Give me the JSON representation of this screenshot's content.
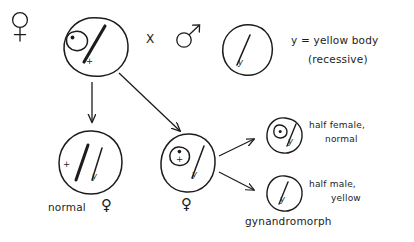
{
  "diagram": {
    "title_present": false,
    "type": "genetics-cross-diagram",
    "ink_color": "#1c1c1c",
    "background": "#ffffff"
  },
  "symbols": {
    "female": "♀",
    "male": "♂",
    "cross": "X",
    "wild_type_allele": "+",
    "yellow_allele": "y"
  },
  "parents": {
    "female_symbol": "♀",
    "female_cell": {
      "name": "ring-x-female-parent",
      "chromosomes": [
        {
          "kind": "ring",
          "label": ""
        },
        {
          "kind": "rod",
          "label": "+"
        }
      ]
    },
    "cross_symbol": "X",
    "male_symbol": "♂",
    "male_cell": {
      "name": "male-parent",
      "chromosomes": [
        {
          "kind": "rod",
          "label": "y"
        }
      ]
    }
  },
  "legend": {
    "line1": "y = yellow body",
    "line2": "(recessive)"
  },
  "offspring": {
    "normal_female": {
      "cell_name": "normal-female-zygote",
      "chromosomes": [
        {
          "kind": "rod-thick",
          "label": "+"
        },
        {
          "kind": "rod",
          "label": "y"
        }
      ],
      "caption": "normal",
      "caption_symbol": "♀"
    },
    "ring_female": {
      "cell_name": "ring-female-zygote",
      "chromosomes": [
        {
          "kind": "ring",
          "label": "+"
        },
        {
          "kind": "rod",
          "label": "y"
        }
      ],
      "caption_symbol": "♀"
    }
  },
  "gynandromorph": {
    "group_caption": "gynandromorph",
    "half_female": {
      "cell_name": "half-female-cell",
      "chromosomes": [
        {
          "kind": "ring",
          "label": ""
        },
        {
          "kind": "rod",
          "label": "y"
        }
      ],
      "line1": "half female,",
      "line2": "normal"
    },
    "half_male": {
      "cell_name": "half-male-cell",
      "chromosomes": [
        {
          "kind": "rod",
          "label": "y"
        }
      ],
      "line1": "half male,",
      "line2": "yellow"
    }
  },
  "arrows": [
    {
      "name": "arrow-parent-to-normal-female",
      "from": "female-parent-cell",
      "to": "normal-female-zygote"
    },
    {
      "name": "arrow-parent-to-ring-female",
      "from": "female-parent-cell",
      "to": "ring-female-zygote"
    },
    {
      "name": "arrow-ring-female-to-half-female",
      "from": "ring-female-zygote",
      "to": "half-female-cell"
    },
    {
      "name": "arrow-ring-female-to-half-male",
      "from": "ring-female-zygote",
      "to": "half-male-cell"
    }
  ]
}
